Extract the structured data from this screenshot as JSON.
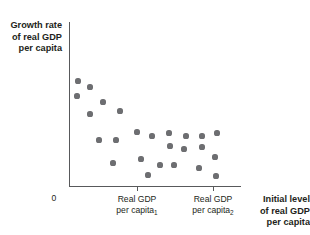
{
  "figure": {
    "kind": "scatter-plot",
    "axis_color": "#58595b",
    "point_color": "#6d6e71",
    "text_color": "#231f20"
  },
  "labels": {
    "y_axis": {
      "line1": "Growth rate",
      "line2": "of real GDP",
      "line3": "per capita"
    },
    "x_axis": {
      "line1": "Initial level",
      "line2": "of real GDP",
      "line3": "per capita"
    },
    "origin": "0",
    "tick1": {
      "line1": "Real GDP",
      "line2": "per capita",
      "subscript": "1"
    },
    "tick2": {
      "line1": "Real GDP",
      "line2": "per capita",
      "subscript": "2"
    }
  },
  "chart_data": {
    "type": "scatter",
    "title": "",
    "xlabel": "Initial level of real GDP per capita",
    "ylabel": "Growth rate of real GDP per capita",
    "grid": false,
    "legend": null,
    "xlim": [
      0,
      1
    ],
    "ylim": [
      0,
      1
    ],
    "xticks": [
      {
        "pos": 0.395,
        "label": "Real GDP per capita₁"
      },
      {
        "pos": 0.837,
        "label": "Real GDP per capita₂"
      }
    ],
    "yticks": [],
    "origin_label": "0",
    "annotation": "Negative relationship: countries starting with lower real GDP per capita tend to grow faster (convergence).",
    "points": [
      {
        "px": 78,
        "py": 81,
        "x": 0.052,
        "y": 0.64
      },
      {
        "px": 90,
        "py": 87,
        "x": 0.122,
        "y": 0.604
      },
      {
        "px": 77,
        "py": 96,
        "x": 0.047,
        "y": 0.549
      },
      {
        "px": 103,
        "py": 102,
        "x": 0.198,
        "y": 0.512
      },
      {
        "px": 120,
        "py": 111,
        "x": 0.297,
        "y": 0.457
      },
      {
        "px": 90,
        "py": 114,
        "x": 0.122,
        "y": 0.439
      },
      {
        "px": 137,
        "py": 132,
        "x": 0.395,
        "y": 0.329
      },
      {
        "px": 99,
        "py": 140,
        "x": 0.174,
        "y": 0.28
      },
      {
        "px": 116,
        "py": 140,
        "x": 0.273,
        "y": 0.28
      },
      {
        "px": 152,
        "py": 136,
        "x": 0.483,
        "y": 0.305
      },
      {
        "px": 169,
        "py": 133,
        "x": 0.581,
        "y": 0.323
      },
      {
        "px": 170,
        "py": 146,
        "x": 0.587,
        "y": 0.244
      },
      {
        "px": 186,
        "py": 136,
        "x": 0.68,
        "y": 0.305
      },
      {
        "px": 202,
        "py": 136,
        "x": 0.773,
        "y": 0.305
      },
      {
        "px": 217,
        "py": 133,
        "x": 0.86,
        "y": 0.323
      },
      {
        "px": 184,
        "py": 149,
        "x": 0.669,
        "y": 0.226
      },
      {
        "px": 202,
        "py": 147,
        "x": 0.773,
        "y": 0.238
      },
      {
        "px": 215,
        "py": 157,
        "x": 0.849,
        "y": 0.177
      },
      {
        "px": 113,
        "py": 163,
        "x": 0.256,
        "y": 0.14
      },
      {
        "px": 141,
        "py": 159,
        "x": 0.419,
        "y": 0.165
      },
      {
        "px": 160,
        "py": 165,
        "x": 0.529,
        "y": 0.128
      },
      {
        "px": 174,
        "py": 165,
        "x": 0.61,
        "y": 0.128
      },
      {
        "px": 148,
        "py": 175,
        "x": 0.459,
        "y": 0.067
      },
      {
        "px": 199,
        "py": 168,
        "x": 0.756,
        "y": 0.11
      },
      {
        "px": 216,
        "py": 176,
        "x": 0.855,
        "y": 0.061
      }
    ]
  }
}
